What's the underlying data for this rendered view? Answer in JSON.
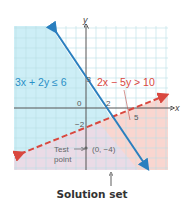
{
  "diagram": {
    "type": "system-of-linear-inequalities-graph",
    "axes": {
      "x_label": "x",
      "y_label": "y",
      "origin_label": "0"
    },
    "grid": {
      "x_range": [
        -8,
        8
      ],
      "y_range": [
        -6,
        8
      ],
      "unit_px": 10
    },
    "inequalities": [
      {
        "label": "3x + 2y ≤ 6",
        "boundary": "solid",
        "color": "#2a7fbf",
        "shade": "#cdeef6",
        "shade_side": "below-left"
      },
      {
        "label": "2x − 5y > 10",
        "boundary": "dashed",
        "color": "#d9483f",
        "shade": "#f9d6d0",
        "shade_side": "below-right"
      }
    ],
    "intercept_labels": {
      "blue_y_intercept": "3",
      "blue_x_intercept": "2",
      "red_y_intercept": "−2",
      "red_x_intercept": "5"
    },
    "test_point": {
      "label": "Test point",
      "label_line1": "Test",
      "label_line2": "point",
      "coords": "(0, −4)"
    },
    "solution_caption": "Solution set",
    "colors": {
      "overlap_shade": "#eadbe6",
      "grid_line": "#b8dfe6",
      "axis": "#555555"
    }
  }
}
